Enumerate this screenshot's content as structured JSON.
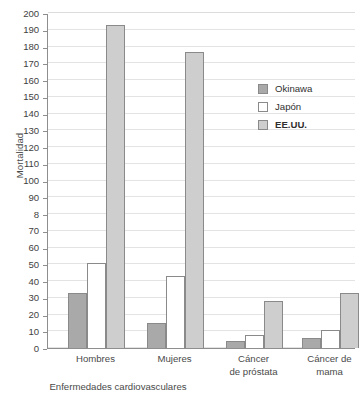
{
  "chart_data": {
    "type": "bar",
    "title": "",
    "subtitle": "",
    "xlabel": "",
    "ylabel": "Mortalidad",
    "ylim": [
      0,
      200
    ],
    "ytick_step": 10,
    "grid": true,
    "legend_position": "inside-upper-right",
    "categories": [
      "Hombres",
      "Mujeres",
      "Cáncer\nde próstata",
      "Cáncer de\nmama"
    ],
    "category_labels_flat": [
      "Hombres",
      "Mujeres",
      "Cáncer de próstata",
      "Cáncer de mama"
    ],
    "group_caption": "Enfermedades cardiovasculares",
    "series": [
      {
        "name": "Okinawa",
        "color": "#a9a9a9",
        "values": [
          33,
          15,
          4,
          6
        ]
      },
      {
        "name": "Japón",
        "color": "#ffffff",
        "values": [
          51,
          43,
          8,
          11
        ]
      },
      {
        "name": "EE.UU.",
        "color": "#cecece",
        "values": [
          193,
          177,
          28,
          33
        ]
      }
    ],
    "ytick_labels": [
      "0",
      "10",
      "20",
      "30",
      "40",
      "50",
      "60",
      "70",
      "8",
      "90",
      "100",
      "110",
      "120",
      "130",
      "140",
      "150",
      "160",
      "170",
      "180",
      "190",
      "200"
    ],
    "ytick_values": [
      0,
      10,
      20,
      30,
      40,
      50,
      60,
      70,
      80,
      90,
      100,
      110,
      120,
      130,
      140,
      150,
      160,
      170,
      180,
      190,
      200
    ]
  },
  "legend": {
    "entries": [
      {
        "label": "Okinawa",
        "bold": false
      },
      {
        "label": "Japón",
        "bold": false
      },
      {
        "label": "EE.UU.",
        "bold": true
      }
    ]
  },
  "colors": {
    "okinawa": "#a9a9a9",
    "japon": "#ffffff",
    "eeuu": "#cecece",
    "axis": "#8e8e8e",
    "grid": "#e3e3e3",
    "text": "#3a3a3a"
  }
}
